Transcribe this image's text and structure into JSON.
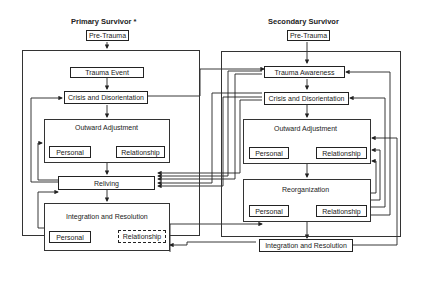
{
  "primary": {
    "title": "Primary Survivor *",
    "pre_trauma": "Pre-Trauma",
    "trauma_event": "Trauma Event",
    "crisis": "Crisis and Disorientation",
    "outward": {
      "label": "Outward Adjustment",
      "personal": "Personal",
      "relationship": "Relationship"
    },
    "reliving": "Reliving",
    "integration": {
      "label": "Integration and Resolution",
      "personal": "Personal",
      "relationship": "Relationship"
    }
  },
  "secondary": {
    "title": "Secondary Survivor",
    "pre_trauma": "Pre-Trauma",
    "trauma_awareness": "Trauma Awareness",
    "crisis": "Crisis and Disorientation",
    "outward": {
      "label": "Outward Adjustment",
      "personal": "Personal",
      "relationship": "Relationship"
    },
    "reorganization": {
      "label": "Reorganization",
      "personal": "Personal",
      "relationship": "Relationship"
    },
    "integration": "Integration and Resolution"
  },
  "colors": {
    "line": "#222222",
    "background": "#ffffff"
  }
}
